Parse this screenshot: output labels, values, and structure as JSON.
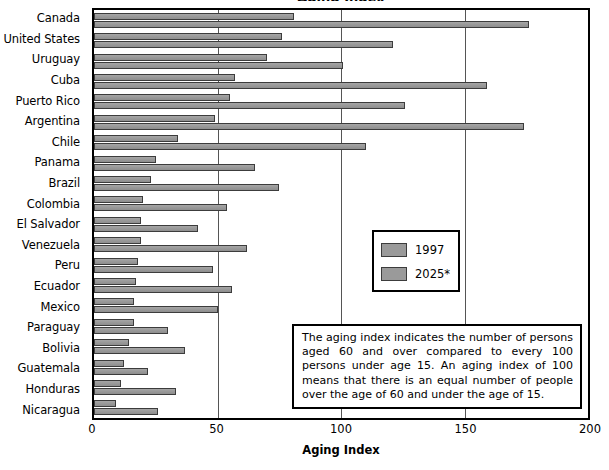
{
  "chart_data": {
    "type": "bar",
    "orientation": "horizontal",
    "title": "Aging Index",
    "xlabel": "Aging Index",
    "ylabel": "",
    "xlim": [
      0,
      200
    ],
    "xticks": [
      0,
      50,
      100,
      150,
      200
    ],
    "xtick_labels": [
      "0",
      "50",
      "100",
      "150",
      "200"
    ],
    "grid": true,
    "legend_position": "inside-right",
    "categories": [
      "Canada",
      "United States",
      "Uruguay",
      "Cuba",
      "Puerto Rico",
      "Argentina",
      "Chile",
      "Panama",
      "Brazil",
      "Colombia",
      "El Salvador",
      "Venezuela",
      "Peru",
      "Ecuador",
      "Mexico",
      "Paraguay",
      "Bolivia",
      "Guatemala",
      "Honduras",
      "Nicaragua"
    ],
    "series": [
      {
        "name": "1997",
        "color": "#9a9a9a",
        "values": [
          81,
          76,
          70,
          57,
          55,
          49,
          34,
          25,
          23,
          20,
          19,
          19,
          18,
          17,
          16,
          16,
          14,
          12,
          11,
          9
        ]
      },
      {
        "name": "2025*",
        "color": "#9a9a9a",
        "values": [
          176,
          121,
          101,
          159,
          126,
          174,
          110,
          65,
          75,
          54,
          42,
          62,
          48,
          56,
          50,
          30,
          37,
          22,
          33,
          26
        ]
      }
    ],
    "annotations": [
      "The aging index indicates the number of persons aged 60 and over compared to every 100 persons under age 15. An aging index of 100 means that there is an equal number of people over the age of 60 and under the age of 15."
    ]
  },
  "legend": {
    "entries": [
      {
        "label": "1997"
      },
      {
        "label": "2025*"
      }
    ]
  },
  "note": {
    "text": "The aging index indicates the number of persons aged 60 and over compared to every 100 persons under age 15. An aging index of 100 means that there is an equal number of people over the age of 60 and under the age of 15."
  },
  "axis": {
    "x_title": "Aging Index"
  },
  "title_sliver": "Aging Index"
}
